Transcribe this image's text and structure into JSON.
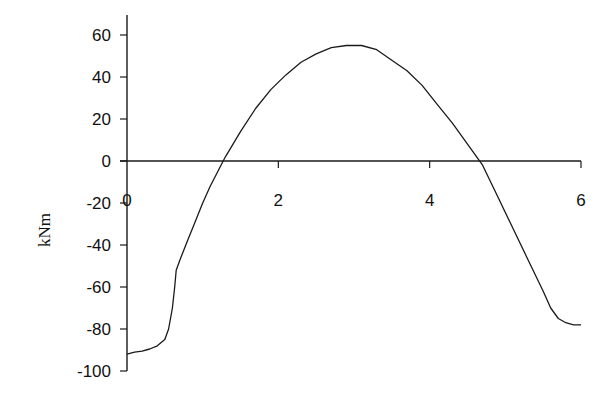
{
  "chart_data": {
    "type": "line",
    "title": "",
    "xlabel": "",
    "ylabel": "kNm",
    "xlim": [
      0,
      6
    ],
    "ylim": [
      -100,
      70
    ],
    "x_ticks": [
      "0",
      "2",
      "4",
      "6"
    ],
    "y_ticks": [
      "60",
      "40",
      "20",
      "0",
      "-20",
      "-40",
      "-60",
      "-80",
      "-100"
    ],
    "grid": false,
    "legend": "none",
    "series": [
      {
        "name": "Moment",
        "x": [
          0,
          0.1,
          0.2,
          0.3,
          0.4,
          0.5,
          0.55,
          0.6,
          0.63,
          0.65,
          0.7,
          0.8,
          0.9,
          1.0,
          1.1,
          1.2,
          1.3,
          1.5,
          1.7,
          1.9,
          2.1,
          2.3,
          2.5,
          2.7,
          2.9,
          3.0,
          3.1,
          3.3,
          3.5,
          3.7,
          3.9,
          4.1,
          4.3,
          4.5,
          4.7,
          4.9,
          5.1,
          5.3,
          5.5,
          5.6,
          5.7,
          5.8,
          5.9,
          6.0
        ],
        "values": [
          -92,
          -91,
          -90.5,
          -89.5,
          -88,
          -85,
          -80,
          -70,
          -60,
          -52,
          -47,
          -38,
          -29,
          -20,
          -12,
          -5,
          2,
          14,
          25,
          34,
          41,
          47,
          51,
          54,
          55,
          55,
          55,
          53,
          48,
          43,
          36,
          27,
          18,
          8,
          -2,
          -17,
          -32,
          -47,
          -62,
          -70,
          -75,
          -77,
          -78,
          -78
        ]
      }
    ]
  },
  "axes": {
    "ylabel": "kNm",
    "x_ticks": [
      {
        "v": 0,
        "label": "0"
      },
      {
        "v": 2,
        "label": "2"
      },
      {
        "v": 4,
        "label": "4"
      },
      {
        "v": 6,
        "label": "6"
      }
    ],
    "y_ticks": [
      {
        "v": 60,
        "label": "60"
      },
      {
        "v": 40,
        "label": "40"
      },
      {
        "v": 20,
        "label": "20"
      },
      {
        "v": 0,
        "label": "0"
      },
      {
        "v": -20,
        "label": "-20"
      },
      {
        "v": -40,
        "label": "-40"
      },
      {
        "v": -60,
        "label": "-60"
      },
      {
        "v": -80,
        "label": "-80"
      },
      {
        "v": -100,
        "label": "-100"
      }
    ]
  },
  "style": {
    "line_color": "#1a1a1a",
    "axis_color": "#1a1a1a"
  }
}
